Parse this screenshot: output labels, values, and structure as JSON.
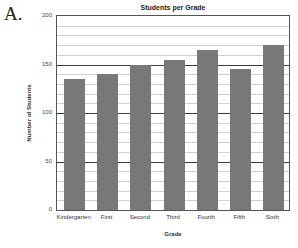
{
  "problem_label": "A.",
  "chart_data": {
    "type": "bar",
    "title": "Students per Grade",
    "xlabel": "Grade",
    "ylabel": "Number of Students",
    "categories": [
      "Kindergarten",
      "First",
      "Second",
      "Third",
      "Fourth",
      "Fifth",
      "Sixth"
    ],
    "values": [
      135,
      140,
      150,
      155,
      165,
      145,
      170
    ],
    "ylim": [
      0,
      200
    ],
    "yticks": [
      0,
      50,
      100,
      150,
      200
    ],
    "grid": {
      "major_step": 50,
      "minor_step": 10
    },
    "legend": null,
    "bar_color": "#787878"
  }
}
